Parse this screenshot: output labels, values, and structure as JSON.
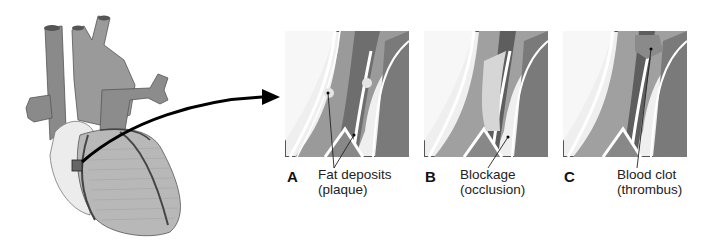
{
  "figure": {
    "heart_label": "Heart with coronary arteries",
    "panels": [
      {
        "letter": "A",
        "caption_line1": "Fat deposits",
        "caption_line2": "(plaque)"
      },
      {
        "letter": "B",
        "caption_line1": "Blockage",
        "caption_line2": "(occlusion)"
      },
      {
        "letter": "C",
        "caption_line1": "Blood clot",
        "caption_line2": "(thrombus)"
      }
    ]
  },
  "colors": {
    "background": "#ffffff",
    "tissue_light": "#e6e6e6",
    "vessel_wall": "#9a9a9a",
    "lumen_dark": "#6a6a6a",
    "plaque": "#d8d8d8",
    "heart_body": "#b8b8b8",
    "vessels_great": "#8c8c8c",
    "arrow": "#000000"
  }
}
